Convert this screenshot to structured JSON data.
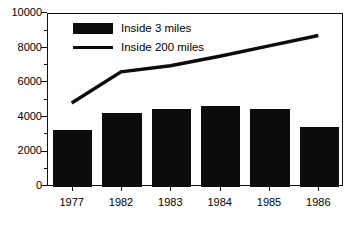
{
  "chart_data": {
    "type": "bar",
    "title": "",
    "xlabel": "",
    "ylabel": "",
    "categories": [
      "1977",
      "1982",
      "1983",
      "1984",
      "1985",
      "1986"
    ],
    "ylim": [
      0,
      10000
    ],
    "ytick_labels": [
      "0",
      "2000",
      "4000",
      "6000",
      "8000",
      "10000"
    ],
    "ytick_values": [
      0,
      2000,
      4000,
      6000,
      8000,
      10000
    ],
    "yminor_values": [
      1000,
      3000,
      5000,
      7000,
      9000
    ],
    "grid": false,
    "legend_position": "top-left",
    "series": [
      {
        "name": "Inside 3 miles",
        "type": "bar",
        "values": [
          3300,
          4300,
          4500,
          4680,
          4500,
          3450
        ]
      },
      {
        "name": "Inside 200 miles",
        "type": "line",
        "values": [
          4800,
          6600,
          6950,
          7500,
          8100,
          8700
        ]
      }
    ]
  },
  "legend": {
    "items": [
      {
        "label": "Inside 3 miles",
        "marker": "filled-rect"
      },
      {
        "label": "Inside 200 miles",
        "marker": "line-segment"
      }
    ]
  },
  "colors": {
    "bar": "#0c0c0c",
    "line": "#0c0c0c",
    "axis": "#111111",
    "background": "#ffffff",
    "text": "#000000"
  }
}
